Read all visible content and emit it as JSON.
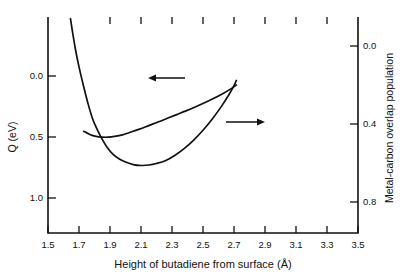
{
  "chart_data": {
    "type": "line",
    "title": "",
    "xlabel": "Height of butadiene from surface (Å)",
    "xlim": [
      1.5,
      3.5
    ],
    "xticks": [
      "1.5",
      "1.7",
      "1.9",
      "2.1",
      "2.3",
      "2.5",
      "2.7",
      "2.9",
      "3.1",
      "3.3",
      "3.5"
    ],
    "xtick_values": [
      1.5,
      1.7,
      1.9,
      2.1,
      2.3,
      2.5,
      2.7,
      2.9,
      3.1,
      3.3,
      3.5
    ],
    "ylabel_left": "Q (eV)",
    "ylim_left": [
      1.18,
      -0.25
    ],
    "yticks_left": [
      "0.0",
      "0.5",
      "1.0"
    ],
    "ytick_values_left": [
      0.0,
      0.5,
      1.0
    ],
    "ylabel_right": "Metal-carbon overlap population",
    "ylim_right": [
      0.95,
      -0.15
    ],
    "yticks_right": [
      "0.0",
      "0.4",
      "0.8"
    ],
    "ytick_values_right": [
      0.0,
      0.4,
      0.8
    ],
    "grid": false,
    "legend": "none",
    "axis_direction_note": "Both vertical axes increase downward",
    "series": [
      {
        "name": "Q (eV)",
        "axis": "left",
        "arrow": "left",
        "points": [
          [
            1.645,
            -0.24
          ],
          [
            1.66,
            -0.14
          ],
          [
            1.68,
            -0.02
          ],
          [
            1.7,
            0.08
          ],
          [
            1.73,
            0.21
          ],
          [
            1.76,
            0.33
          ],
          [
            1.79,
            0.43
          ],
          [
            1.82,
            0.5
          ],
          [
            1.85,
            0.56
          ],
          [
            1.88,
            0.61
          ],
          [
            1.92,
            0.66
          ],
          [
            1.96,
            0.69
          ],
          [
            2.0,
            0.71
          ],
          [
            2.05,
            0.727
          ],
          [
            2.1,
            0.733
          ],
          [
            2.15,
            0.73
          ],
          [
            2.2,
            0.72
          ],
          [
            2.26,
            0.7
          ],
          [
            2.32,
            0.665
          ],
          [
            2.38,
            0.62
          ],
          [
            2.44,
            0.565
          ],
          [
            2.5,
            0.5
          ],
          [
            2.56,
            0.425
          ],
          [
            2.62,
            0.34
          ],
          [
            2.67,
            0.26
          ],
          [
            2.7,
            0.205
          ],
          [
            2.715,
            0.17
          ]
        ]
      },
      {
        "name": "Metal-carbon overlap population",
        "axis": "right",
        "arrow": "right",
        "points": [
          [
            1.73,
            0.432
          ],
          [
            1.77,
            0.448
          ],
          [
            1.81,
            0.458
          ],
          [
            1.85,
            0.462
          ],
          [
            1.89,
            0.462
          ],
          [
            1.93,
            0.458
          ],
          [
            1.98,
            0.45
          ],
          [
            2.03,
            0.437
          ],
          [
            2.09,
            0.421
          ],
          [
            2.15,
            0.403
          ],
          [
            2.21,
            0.385
          ],
          [
            2.27,
            0.366
          ],
          [
            2.33,
            0.347
          ],
          [
            2.39,
            0.328
          ],
          [
            2.45,
            0.308
          ],
          [
            2.51,
            0.287
          ],
          [
            2.57,
            0.264
          ],
          [
            2.63,
            0.239
          ],
          [
            2.69,
            0.211
          ],
          [
            2.715,
            0.196
          ]
        ]
      }
    ],
    "annotations": [
      {
        "name": "left-axis-arrow",
        "points_to": "left",
        "x_start": 2.7,
        "x_end": 2.26,
        "y_left": -0.015
      },
      {
        "name": "right-axis-arrow",
        "points_to": "right",
        "x_start": 2.68,
        "x_end": 2.95,
        "y_right": 0.393
      }
    ]
  },
  "axes": {
    "x_title": "Height of butadiene from surface (Å)",
    "y_left_title": "Q (eV)",
    "y_right_title": "Metal-carbon overlap population",
    "x_tick_labels": [
      "1.5",
      "1.7",
      "1.9",
      "2.1",
      "2.3",
      "2.5",
      "2.7",
      "2.9",
      "3.1",
      "3.3",
      "3.5"
    ],
    "y_left_tick_labels": [
      "0.0",
      "0.5",
      "1.0"
    ],
    "y_right_tick_labels": [
      "0.0",
      "0.4",
      "0.8"
    ]
  },
  "style": {
    "line_color": "#111111",
    "background": "#ffffff"
  }
}
